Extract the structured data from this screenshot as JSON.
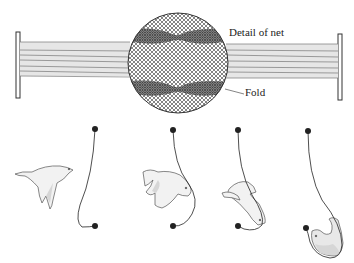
{
  "figure": {
    "labels": {
      "detail": "Detail of net",
      "fold": "Fold"
    },
    "colors": {
      "ink": "#222222",
      "net_band": "#c9c9c9",
      "bird_fill": "#f2f2f2",
      "bird_shade": "#d6d6d6"
    },
    "sequence": [
      {
        "step": 1,
        "description": "bird flying toward net"
      },
      {
        "step": 2,
        "description": "bird strikes net, pushing pocket"
      },
      {
        "step": 3,
        "description": "bird falls into fold"
      },
      {
        "step": 4,
        "description": "bird held in pocket of fold"
      }
    ]
  }
}
